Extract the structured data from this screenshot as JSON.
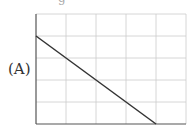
{
  "label": "(A)",
  "top_fragment": "g",
  "chart_data": {
    "type": "line",
    "title": "",
    "xlabel": "",
    "ylabel": "",
    "grid": true,
    "x_divisions": 5,
    "y_divisions": 5,
    "xlim": [
      0,
      5
    ],
    "ylim": [
      0,
      5
    ],
    "series": [
      {
        "name": "A",
        "x": [
          0,
          4
        ],
        "y": [
          4,
          0
        ]
      }
    ],
    "colors": {
      "line": "#333333",
      "grid": "#cccccc",
      "axis": "#555555"
    }
  }
}
